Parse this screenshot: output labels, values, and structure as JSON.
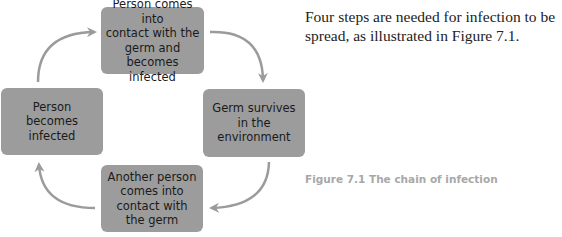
{
  "diagram": {
    "title": "The chain of infection",
    "steps": [
      {
        "id": "top",
        "label": "Person comes into\ncontact with the\ngerm and becomes\ninfected"
      },
      {
        "id": "right",
        "label": "Germ survives\nin the\nenvironment"
      },
      {
        "id": "bottom",
        "label": "Another person\ncomes into\ncontact with\nthe germ"
      },
      {
        "id": "left",
        "label": "Person\nbecomes\ninfected"
      }
    ],
    "flow": [
      "top",
      "right",
      "bottom",
      "left",
      "top"
    ],
    "colors": {
      "box": "#9c9c9c",
      "arrow": "#9b9b9b",
      "caption": "#a8a8a8"
    }
  },
  "text": {
    "intro": "Four steps are needed for infection to be spread, as illustrated in Figure 7.1.",
    "caption": "Figure 7.1 The chain of infection"
  }
}
